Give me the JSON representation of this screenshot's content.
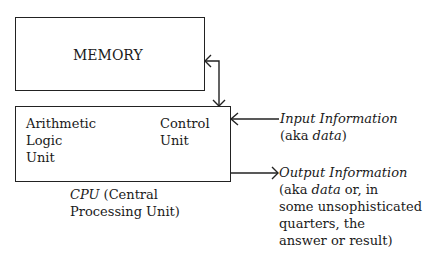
{
  "memory": {
    "label": "MEMORY"
  },
  "cpu": {
    "alu": [
      "Arithmetic",
      "Logic",
      "Unit"
    ],
    "control": [
      "Control",
      "Unit"
    ],
    "caption_italic": "CPU",
    "caption_rest": " (Central",
    "caption_line2": "Processing Unit)"
  },
  "input": {
    "title": "Input Information",
    "note_pre": "(aka ",
    "note_italic": "data",
    "note_post": ")"
  },
  "output": {
    "title": "Output Information",
    "line1_pre": "(aka ",
    "line1_italic": "data",
    "line1_post": " or, in",
    "line2": "some unsophisticated",
    "line3": "quarters, the",
    "line4": "answer or result)"
  }
}
